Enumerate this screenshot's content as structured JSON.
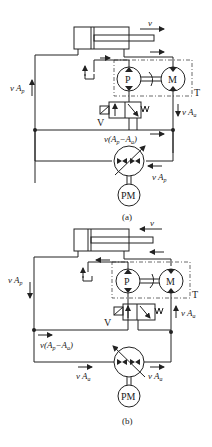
{
  "figure": {
    "panels": [
      {
        "id": "a",
        "caption": "(a)",
        "velocity_label": "v",
        "pump_label": "P",
        "motor_label": "M",
        "transformer_label": "T",
        "valve_label": "V",
        "prime_mover_label": "PM",
        "flow_left": "v A",
        "flow_left_sub": "p",
        "flow_right": "v A",
        "flow_right_sub": "a",
        "flow_mid": "v(A",
        "flow_mid_sub1": "p",
        "flow_mid_mid": "−A",
        "flow_mid_sub2": "a",
        "flow_mid_end": ")",
        "flow_pump": "v A",
        "flow_pump_sub": "p"
      },
      {
        "id": "b",
        "caption": "(b)",
        "velocity_label": "v",
        "pump_label": "P",
        "motor_label": "M",
        "transformer_label": "T",
        "valve_label": "V",
        "prime_mover_label": "PM",
        "flow_left": "v A",
        "flow_left_sub": "p",
        "flow_right": "v A",
        "flow_right_sub": "a",
        "flow_mid": "v(A",
        "flow_mid_sub1": "p",
        "flow_mid_mid": "−A",
        "flow_mid_sub2": "a",
        "flow_mid_end": ")",
        "flow_pump_left": "v A",
        "flow_pump_left_sub": "a",
        "flow_pump_right": "v A",
        "flow_pump_right_sub": "a"
      }
    ]
  }
}
